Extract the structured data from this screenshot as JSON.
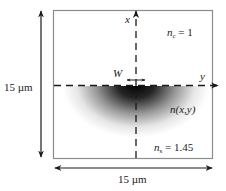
{
  "diagram": {
    "type": "waveguide-cross-section",
    "region_width_label": "15 µm",
    "region_height_label": "15 µm",
    "axes": {
      "x_label": "x",
      "y_label": "y"
    },
    "width_label": "W",
    "cladding": {
      "symbol": "n",
      "subscript": "c",
      "value": "= 1"
    },
    "index_profile_label": "n(x,y)",
    "substrate": {
      "symbol": "n",
      "subscript": "s",
      "value": "= 1.45"
    },
    "colors": {
      "box_border": "#8c8c8c",
      "line": "#1a1a1a",
      "gradient_core": "#000000",
      "background": "#ffffff"
    }
  }
}
